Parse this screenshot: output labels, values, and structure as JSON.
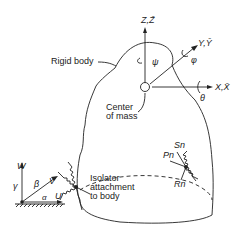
{
  "labels": {
    "rigid_body": "Rigid body",
    "center_of_mass_1": "Center",
    "center_of_mass_2": "of mass",
    "z_axis": "Z,Z̄",
    "y_axis": "Y,Ȳ",
    "x_axis": "X,X̄",
    "psi": "ψ",
    "phi": "φ",
    "theta": "θ",
    "isolator_1": "Isolator",
    "isolator_2": "attachment",
    "isolator_3": "to body",
    "w": "W",
    "v": "V",
    "u": "U",
    "gamma": "γ",
    "beta": "β",
    "alpha": "α",
    "s_n": "Sn",
    "p_n": "Pn",
    "r_n": "Rn"
  },
  "colors": {
    "line": "#222222",
    "background": "#ffffff"
  }
}
